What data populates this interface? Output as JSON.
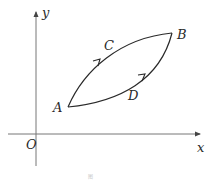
{
  "diagram": {
    "type": "coordinate-path-diagram",
    "axes": {
      "x_label": "x",
      "y_label": "y",
      "origin_label": "O"
    },
    "points": [
      {
        "name": "A",
        "label": "A"
      },
      {
        "name": "B",
        "label": "B"
      },
      {
        "name": "C",
        "label": "C"
      },
      {
        "name": "D",
        "label": "D"
      }
    ],
    "paths": [
      {
        "name": "upper-path",
        "via": "C",
        "from": "A",
        "to": "B",
        "direction": "A to B"
      },
      {
        "name": "lower-path",
        "via": "D",
        "from": "A",
        "to": "B",
        "direction": "A to B"
      }
    ],
    "caption": "图"
  },
  "colors": {
    "axis": "#666666",
    "curve": "#2a2a2a",
    "label": "#2a2a2a"
  }
}
